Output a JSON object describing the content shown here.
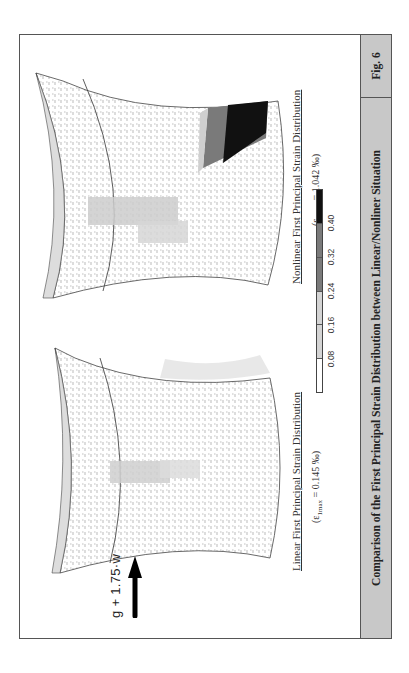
{
  "load_case": {
    "label": "g + 1.75·w",
    "arrow_icon": "arrow-right-icon"
  },
  "figures": [
    {
      "title": "Linear First Principal Strain Distribution",
      "eps_prefix": "(ε",
      "eps_sub": "1max",
      "eps_value": " = 0.145 ‰)"
    },
    {
      "title": "Nonlinear First Principal Strain Distribution",
      "eps_prefix": "(ε",
      "eps_sub": "1max",
      "eps_value": " = 1.042 ‰)"
    }
  ],
  "legend": {
    "ticks": [
      "0.08",
      "0.16",
      "0.24",
      "0.32",
      "0.40"
    ],
    "colors": [
      "#ffffff",
      "#d4d4d4",
      "#d4d4d4",
      "#7a7a7a",
      "#7a7a7a",
      "#111111"
    ]
  },
  "caption": {
    "title": "Comparison of the First Principal Strain Distribution between Linear/Nonliner Situation",
    "fig_label": "Fig. 6"
  }
}
